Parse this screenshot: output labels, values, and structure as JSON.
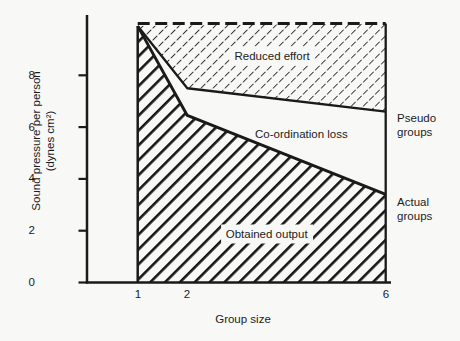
{
  "figure": {
    "background": "#f8f8f6",
    "ink": "#1a1a1a"
  },
  "chart_data": {
    "type": "area",
    "title": "",
    "xlabel": "Group size",
    "ylabel": "Sound pressure per person (dynes cm²)",
    "ylabel_lines": [
      "Sound pressure per person",
      "(dynes cm²)"
    ],
    "x_ticks": [
      1,
      2,
      6
    ],
    "y_ticks": [
      0,
      2,
      4,
      6,
      8
    ],
    "xlim": [
      1,
      6
    ],
    "ylim": [
      0,
      10.4
    ],
    "grid": false,
    "legend_position": "right-margin",
    "series": [
      {
        "name": "Potential productivity",
        "role": "potential",
        "line_style": "dashed",
        "x": [
          1,
          6
        ],
        "y": [
          10,
          10
        ]
      },
      {
        "name": "Pseudo groups",
        "role": "pseudo",
        "line_style": "solid",
        "x": [
          1,
          2,
          6
        ],
        "y": [
          9.9,
          7.5,
          6.6
        ]
      },
      {
        "name": "Actual groups",
        "role": "actual",
        "line_style": "solid",
        "x": [
          1,
          2,
          6
        ],
        "y": [
          9.9,
          6.45,
          3.4
        ]
      }
    ],
    "regions": [
      {
        "label": "Reduced effort",
        "between": [
          "potential",
          "pseudo"
        ],
        "fill": "thin-diagonal-hatch"
      },
      {
        "label": "Co-ordination loss",
        "between": [
          "pseudo",
          "actual"
        ],
        "fill": "white"
      },
      {
        "label": "Obtained output",
        "between": [
          "actual",
          "baseline"
        ],
        "fill": "thick-diagonal-stripes"
      }
    ],
    "right_labels": [
      "Pseudo groups",
      "Actual groups"
    ],
    "annotations": {
      "reduced_effort": {
        "x": 3.71,
        "y": 8.75
      },
      "coordination_loss": {
        "x": 4.3,
        "y": 5.74
      },
      "obtained_output": {
        "x": 3.6,
        "y": 1.87
      },
      "pseudo_groups": {
        "x": 6.19,
        "y": 6.08
      },
      "actual_groups": {
        "x": 6.19,
        "y": 2.82
      }
    }
  }
}
